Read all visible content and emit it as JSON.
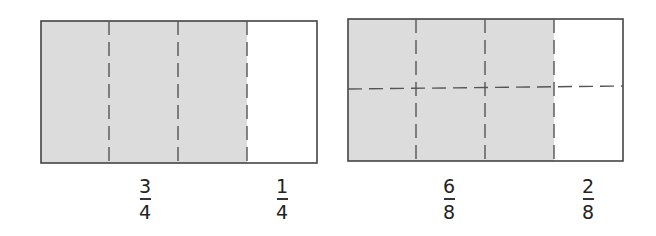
{
  "figures": [
    {
      "name": "quarters-model",
      "parts": 4,
      "shaded_parts": 3,
      "shaded_fraction": {
        "numerator": "3",
        "denominator": "4"
      },
      "unshaded_fraction": {
        "numerator": "1",
        "denominator": "4"
      }
    },
    {
      "name": "eighths-model",
      "parts": 8,
      "shaded_parts": 6,
      "shaded_fraction": {
        "numerator": "6",
        "denominator": "8"
      },
      "unshaded_fraction": {
        "numerator": "2",
        "denominator": "8"
      }
    }
  ],
  "colors": {
    "shade": "#dcdcdc",
    "outline": "#444444",
    "dash": "#555555",
    "text": "#222222"
  }
}
